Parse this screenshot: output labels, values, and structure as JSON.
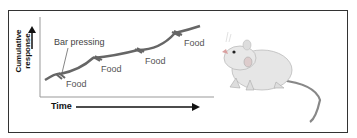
{
  "diagram": {
    "y_axis_label_line1": "Cumulative",
    "y_axis_label_line2": "response",
    "x_axis_label": "Time",
    "annotation": "Bar pressing",
    "food_labels": [
      "Food",
      "Food",
      "Food",
      "Food"
    ],
    "curve_color": "#666666",
    "image_subject": "rat"
  }
}
